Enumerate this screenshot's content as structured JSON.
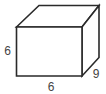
{
  "figure": {
    "type": "rectangular-prism-diagram",
    "labels": {
      "height": "6",
      "width": "6",
      "depth": "9"
    }
  },
  "colors": {
    "line": "#2a2a2a",
    "label": "#444444",
    "background": "#ffffff"
  }
}
